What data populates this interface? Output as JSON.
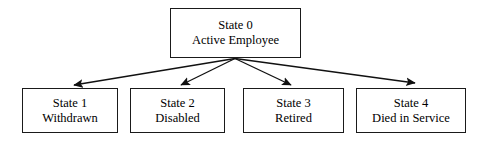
{
  "diagram": {
    "stroke_color": "#1a1a1a",
    "background_color": "#ffffff",
    "nodes": [
      {
        "id": "state-0",
        "state_label": "State 0",
        "name_label": "Active Employee",
        "role": "root"
      },
      {
        "id": "state-1",
        "state_label": "State 1",
        "name_label": "Withdrawn",
        "role": "leaf"
      },
      {
        "id": "state-2",
        "state_label": "State 2",
        "name_label": "Disabled",
        "role": "leaf"
      },
      {
        "id": "state-3",
        "state_label": "State 3",
        "name_label": "Retired",
        "role": "leaf"
      },
      {
        "id": "state-4",
        "state_label": "State 4",
        "name_label": "Died in Service",
        "role": "leaf"
      }
    ],
    "edges": [
      {
        "id": "edge-0-1",
        "from": "state-0",
        "to": "state-1",
        "arrowhead": "filled-triangle"
      },
      {
        "id": "edge-0-2",
        "from": "state-0",
        "to": "state-2",
        "arrowhead": "filled-triangle"
      },
      {
        "id": "edge-0-3",
        "from": "state-0",
        "to": "state-3",
        "arrowhead": "filled-triangle"
      },
      {
        "id": "edge-0-4",
        "from": "state-0",
        "to": "state-4",
        "arrowhead": "filled-triangle"
      }
    ]
  }
}
